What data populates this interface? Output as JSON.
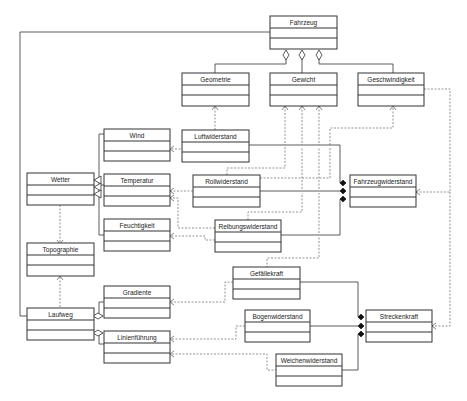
{
  "diagram": {
    "type": "UML class diagram",
    "classes": {
      "fahrzeug": {
        "name": "Fahrzeug"
      },
      "geometrie": {
        "name": "Geometrie"
      },
      "gewicht": {
        "name": "Gewicht"
      },
      "geschwindigkeit": {
        "name": "Geschwindigkeit"
      },
      "wind": {
        "name": "Wind"
      },
      "luftwiderstand": {
        "name": "Luftwiderstand"
      },
      "wetter": {
        "name": "Wetter"
      },
      "temperatur": {
        "name": "Temperatur"
      },
      "rollwiderstand": {
        "name": "Rollwiderstand"
      },
      "fahrzeugwiderstand": {
        "name": "Fahrzeugwiderstand"
      },
      "feuchtigkeit": {
        "name": "Feuchtigkeit"
      },
      "reibungswiderstand": {
        "name": "Reibungswiderstand"
      },
      "topographie": {
        "name": "Topographie"
      },
      "gefaellekraft": {
        "name": "Gefällekraft"
      },
      "gradiente": {
        "name": "Gradiente"
      },
      "laufweg": {
        "name": "Laufweg"
      },
      "bogenwiderstand": {
        "name": "Bogenwiderstand"
      },
      "streckenkraft": {
        "name": "Streckenkraft"
      },
      "linienfuehrung": {
        "name": "Linienführung"
      },
      "weichenwiderstand": {
        "name": "Weichenwiderstand"
      }
    },
    "relationships": [
      {
        "type": "aggregation",
        "whole": "Fahrzeug",
        "part": "Geometrie"
      },
      {
        "type": "aggregation",
        "whole": "Fahrzeug",
        "part": "Gewicht"
      },
      {
        "type": "aggregation",
        "whole": "Fahrzeug",
        "part": "Geschwindigkeit"
      },
      {
        "type": "aggregation",
        "whole": "Fahrzeug",
        "part": "Laufweg"
      },
      {
        "type": "generalization",
        "child": "Wind",
        "parent": "Wetter"
      },
      {
        "type": "generalization",
        "child": "Temperatur",
        "parent": "Wetter"
      },
      {
        "type": "generalization",
        "child": "Feuchtigkeit",
        "parent": "Wetter"
      },
      {
        "type": "aggregation",
        "whole": "Laufweg",
        "part": "Gradiente"
      },
      {
        "type": "aggregation",
        "whole": "Laufweg",
        "part": "Linienführung"
      },
      {
        "type": "composition",
        "whole": "Fahrzeugwiderstand",
        "part": "Luftwiderstand"
      },
      {
        "type": "composition",
        "whole": "Fahrzeugwiderstand",
        "part": "Rollwiderstand"
      },
      {
        "type": "composition",
        "whole": "Fahrzeugwiderstand",
        "part": "Reibungswiderstand"
      },
      {
        "type": "composition",
        "whole": "Streckenkraft",
        "part": "Gefällekraft"
      },
      {
        "type": "composition",
        "whole": "Streckenkraft",
        "part": "Bogenwiderstand"
      },
      {
        "type": "composition",
        "whole": "Streckenkraft",
        "part": "Weichenwiderstand"
      },
      {
        "type": "dependency",
        "from": "Luftwiderstand",
        "to": "Geometrie"
      },
      {
        "type": "dependency",
        "from": "Luftwiderstand",
        "to": "Wind"
      },
      {
        "type": "dependency",
        "from": "Rollwiderstand",
        "to": "Gewicht"
      },
      {
        "type": "dependency",
        "from": "Rollwiderstand",
        "to": "Temperatur"
      },
      {
        "type": "dependency",
        "from": "Reibungswiderstand",
        "to": "Gewicht"
      },
      {
        "type": "dependency",
        "from": "Reibungswiderstand",
        "to": "Feuchtigkeit"
      },
      {
        "type": "dependency",
        "from": "Reibungswiderstand",
        "to": "Temperatur"
      },
      {
        "type": "dependency",
        "from": "Gefällekraft",
        "to": "Gewicht"
      },
      {
        "type": "dependency",
        "from": "Gefällekraft",
        "to": "Gradiente"
      },
      {
        "type": "dependency",
        "from": "Fahrzeugwiderstand",
        "to": "Geschwindigkeit"
      },
      {
        "type": "dependency",
        "from": "Streckenkraft",
        "to": "Geschwindigkeit"
      },
      {
        "type": "dependency",
        "from": "Wetter",
        "to": "Topographie"
      },
      {
        "type": "dependency",
        "from": "Laufweg",
        "to": "Topographie"
      },
      {
        "type": "dependency",
        "from": "Bogenwiderstand",
        "to": "Linienführung"
      },
      {
        "type": "dependency",
        "from": "Weichenwiderstand",
        "to": "Linienführung"
      }
    ]
  }
}
